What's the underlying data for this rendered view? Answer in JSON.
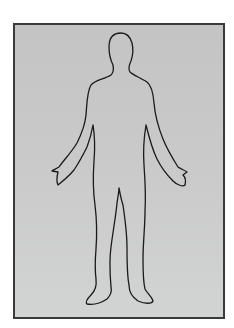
{
  "image": {
    "subject": "human-body-outline",
    "description": "Front-facing outline of a human body, arms slightly away from the sides, on a gray background with a dark border",
    "colors": {
      "background": "#ffffff",
      "panel": "#c8c8c8",
      "border": "#3a3a3a",
      "outline": "#1a1a1a"
    }
  }
}
